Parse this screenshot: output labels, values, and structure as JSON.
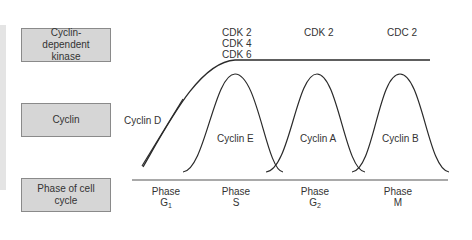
{
  "row_labels": {
    "kinase": "Cyclin-dependent kinase",
    "cyclin": "Cyclin",
    "phase": "Phase of cell cycle"
  },
  "kinases": [
    {
      "lines": [
        "CDK 2",
        "CDK 4",
        "CDK 6"
      ]
    },
    {
      "lines": [
        "CDK 2"
      ]
    },
    {
      "lines": [
        "CDC 2"
      ]
    }
  ],
  "cyclins": [
    "Cyclin D",
    "Cyclin E",
    "Cyclin A",
    "Cyclin B"
  ],
  "phases": [
    {
      "word": "Phase",
      "name": "G",
      "sub": "1"
    },
    {
      "word": "Phase",
      "name": "S",
      "sub": ""
    },
    {
      "word": "Phase",
      "name": "G",
      "sub": "2"
    },
    {
      "word": "Phase",
      "name": "M",
      "sub": ""
    }
  ],
  "colors": {
    "box_fill": "#d6d6d6",
    "box_border": "#8a8a8a",
    "curve": "#2a2a2a",
    "strip": "#e4e4e4"
  }
}
